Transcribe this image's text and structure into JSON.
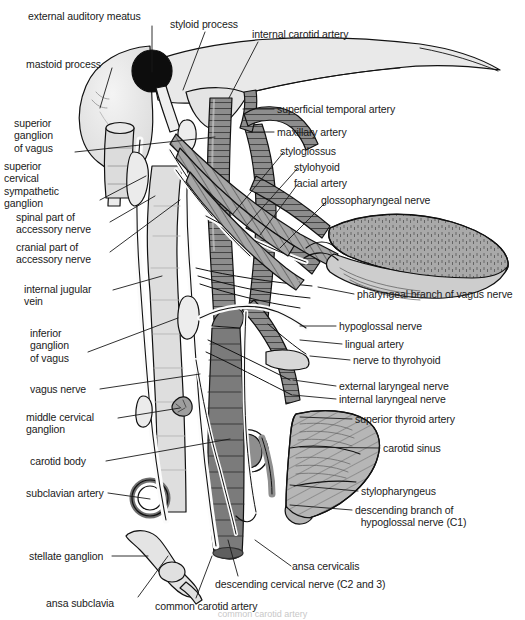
{
  "figure": {
    "background_color": "#ffffff",
    "ink_color": "#1a1a1a",
    "width": 525,
    "height": 620
  },
  "palette": {
    "artery_hatched": "#8f8f8f",
    "artery_dark": "#6f6f6f",
    "vein_light": "#dcdcdc",
    "bone_light": "#e9e9e9",
    "cartilage_gray": "#b4b4b4",
    "muscle_gray": "#9a9a9a",
    "tongue_gray": "#a8a8a8",
    "meatus_black": "#0d0d0d",
    "nerve_white": "#fbfbfb",
    "outline": "#111111"
  },
  "caption": "common carotid artery",
  "labels": [
    {
      "id": "external-auditory-meatus",
      "text": "external auditory meatus",
      "x": 28,
      "y": 10,
      "align": "left",
      "leader": [
        [
          152,
          26
        ],
        [
          152,
          72
        ]
      ]
    },
    {
      "id": "styloid-process",
      "text": "styloid process",
      "x": 170,
      "y": 18,
      "align": "left",
      "leader": [
        [
          205,
          32
        ],
        [
          183,
          90
        ]
      ]
    },
    {
      "id": "internal-carotid-artery",
      "text": "internal carotid artery",
      "x": 252,
      "y": 28,
      "align": "left",
      "leader": [
        [
          258,
          42
        ],
        [
          229,
          98
        ]
      ]
    },
    {
      "id": "mastoid-process",
      "text": "mastoid process",
      "x": 26,
      "y": 58,
      "align": "left",
      "leader": [
        [
          112,
          68
        ],
        [
          100,
          108
        ]
      ]
    },
    {
      "id": "superficial-temporal-artery",
      "text": "superficial temporal artery",
      "x": 277,
      "y": 103,
      "align": "left",
      "leader": [
        [
          274,
          109
        ],
        [
          243,
          109
        ]
      ]
    },
    {
      "id": "maxillary-artery",
      "text": "maxillary artery",
      "x": 277,
      "y": 126,
      "align": "left",
      "leader": [
        [
          274,
          132
        ],
        [
          249,
          132
        ]
      ]
    },
    {
      "id": "superior-ganglion-of-vagus",
      "text": "superior\nganglion\nof vagus",
      "x": 14,
      "y": 117,
      "align": "left",
      "leader": [
        [
          75,
          152
        ],
        [
          215,
          137
        ]
      ]
    },
    {
      "id": "styloglossus",
      "text": "styloglossus",
      "x": 280,
      "y": 145,
      "align": "left",
      "leader": [
        [
          283,
          153
        ],
        [
          232,
          215
        ]
      ]
    },
    {
      "id": "stylohyoid",
      "text": "stylohyoid",
      "x": 294,
      "y": 161,
      "align": "left",
      "leader": [
        [
          297,
          169
        ],
        [
          247,
          225
        ]
      ]
    },
    {
      "id": "facial-artery",
      "text": "facial artery",
      "x": 294,
      "y": 177,
      "align": "left",
      "leader": [
        [
          297,
          185
        ],
        [
          260,
          235
        ]
      ]
    },
    {
      "id": "superior-cervical-sympathetic-ganglion",
      "text": "superior\ncervical\nsympathetic\nganglion",
      "x": 4,
      "y": 160,
      "align": "left",
      "leader": [
        [
          100,
          200
        ],
        [
          146,
          176
        ]
      ]
    },
    {
      "id": "glossopharyngeal-nerve",
      "text": "glossopharyngeal nerve",
      "x": 321,
      "y": 194,
      "align": "left",
      "leader": [
        [
          326,
          202
        ],
        [
          280,
          248
        ]
      ]
    },
    {
      "id": "spinal-part-of-accessory-nerve",
      "text": "spinal part of\naccessory nerve",
      "x": 16,
      "y": 211,
      "align": "left",
      "leader": [
        [
          110,
          222
        ],
        [
          155,
          196
        ]
      ]
    },
    {
      "id": "cranial-part-of-accessory-nerve",
      "text": "cranial part of\naccessory nerve",
      "x": 16,
      "y": 241,
      "align": "left",
      "leader": [
        [
          110,
          252
        ],
        [
          180,
          200
        ]
      ]
    },
    {
      "id": "internal-jugular-vein",
      "text": "internal jugular\nvein",
      "x": 24,
      "y": 283,
      "align": "left",
      "leader": [
        [
          113,
          290
        ],
        [
          162,
          276
        ]
      ]
    },
    {
      "id": "pharyngeal-branch-of-vagus-nerve",
      "text": "pharyngeal branch of vagus nerve",
      "x": 357,
      "y": 288,
      "align": "left",
      "leader": [
        [
          354,
          294
        ],
        [
          318,
          287
        ]
      ]
    },
    {
      "id": "inferior-ganglion-of-vagus",
      "text": "inferior\nganglion\nof vagus",
      "x": 30,
      "y": 327,
      "align": "left",
      "leader": [
        [
          88,
          352
        ],
        [
          178,
          318
        ]
      ]
    },
    {
      "id": "hypoglossal-nerve",
      "text": "hypoglossal nerve",
      "x": 339,
      "y": 320,
      "align": "left",
      "leader": [
        [
          336,
          326
        ],
        [
          300,
          326
        ]
      ]
    },
    {
      "id": "lingual-artery",
      "text": "lingual artery",
      "x": 345,
      "y": 338,
      "align": "left",
      "leader": [
        [
          342,
          344
        ],
        [
          300,
          340
        ]
      ]
    },
    {
      "id": "nerve-to-thyrohyoid",
      "text": "nerve to thyrohyoid",
      "x": 353,
      "y": 354,
      "align": "left",
      "leader": [
        [
          350,
          360
        ],
        [
          310,
          356
        ]
      ]
    },
    {
      "id": "vagus-nerve",
      "text": "vagus nerve",
      "x": 30,
      "y": 383,
      "align": "left",
      "leader": [
        [
          100,
          389
        ],
        [
          200,
          374
        ]
      ]
    },
    {
      "id": "external-laryngeal-nerve",
      "text": "external laryngeal nerve",
      "x": 339,
      "y": 380,
      "align": "left",
      "leader": [
        [
          336,
          386
        ],
        [
          293,
          380
        ]
      ]
    },
    {
      "id": "internal-laryngeal-nerve",
      "text": "internal laryngeal nerve",
      "x": 339,
      "y": 393,
      "align": "left",
      "leader": [
        [
          336,
          399
        ],
        [
          293,
          395
        ]
      ]
    },
    {
      "id": "middle-cervical-ganglion",
      "text": "middle cervical\nganglion",
      "x": 26,
      "y": 411,
      "align": "left",
      "leader": [
        [
          118,
          418
        ],
        [
          180,
          408
        ]
      ]
    },
    {
      "id": "superior-thyroid-artery",
      "text": "superior thyroid artery",
      "x": 355,
      "y": 413,
      "align": "left",
      "leader": [
        [
          352,
          419
        ],
        [
          300,
          417
        ]
      ]
    },
    {
      "id": "carotid-body",
      "text": "carotid body",
      "x": 30,
      "y": 455,
      "align": "left",
      "leader": [
        [
          106,
          461
        ],
        [
          230,
          439
        ]
      ]
    },
    {
      "id": "carotid-sinus",
      "text": "carotid sinus",
      "x": 383,
      "y": 442,
      "align": "left",
      "leader": [
        [
          380,
          448
        ],
        [
          300,
          447
        ]
      ]
    },
    {
      "id": "stylopharyngeus",
      "text": "stylopharyngeus",
      "x": 361,
      "y": 485,
      "align": "left",
      "leader": [
        [
          358,
          491
        ],
        [
          290,
          485
        ]
      ]
    },
    {
      "id": "subclavian-artery",
      "text": "subclavian artery",
      "x": 26,
      "y": 487,
      "align": "left",
      "leader": [
        [
          108,
          493
        ],
        [
          150,
          499
        ]
      ]
    },
    {
      "id": "descending-branch-of-hypoglossal",
      "text": "descending branch of\n  hypoglossal nerve (C1)",
      "x": 355,
      "y": 504,
      "align": "left",
      "leader": [
        [
          352,
          510
        ],
        [
          290,
          505
        ]
      ]
    },
    {
      "id": "stellate-ganglion",
      "text": "stellate ganglion",
      "x": 29,
      "y": 550,
      "align": "left",
      "leader": [
        [
          112,
          556
        ],
        [
          148,
          556
        ]
      ]
    },
    {
      "id": "ansa-cervicalis",
      "text": "ansa cervicalis",
      "x": 292,
      "y": 560,
      "align": "left",
      "leader": [
        [
          291,
          566
        ],
        [
          255,
          540
        ]
      ]
    },
    {
      "id": "descending-cervical-nerve",
      "text": "descending cervical nerve (C2 and 3)",
      "x": 215,
      "y": 578,
      "align": "left",
      "leader": [
        [
          238,
          576
        ],
        [
          228,
          540
        ]
      ]
    },
    {
      "id": "ansa-subclavia",
      "text": "ansa subclavia",
      "x": 46,
      "y": 597,
      "align": "left",
      "leader": [
        [
          138,
          597
        ],
        [
          168,
          556
        ]
      ]
    },
    {
      "id": "common-carotid-artery",
      "text": "common carotid artery",
      "x": 155,
      "y": 600,
      "align": "left",
      "leader": [
        [
          196,
          598
        ],
        [
          212,
          556
        ]
      ]
    }
  ]
}
